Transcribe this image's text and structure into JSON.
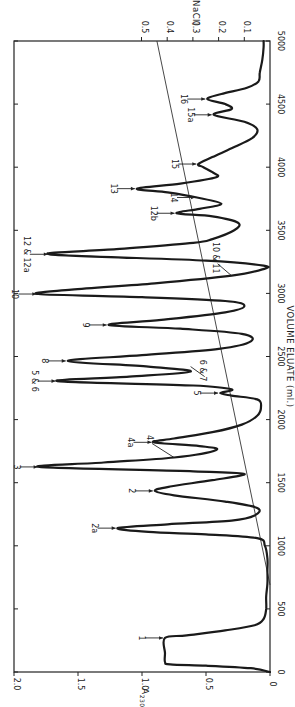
{
  "chart_data": {
    "type": "line",
    "orientation_note": "figure printed rotated 90 degrees counter-clockwise",
    "title": "",
    "xlabel": "VOLUME ELUATE (ml.)",
    "ylabel": "A230",
    "y2label": "[NaCl]",
    "xlim": [
      0,
      5000
    ],
    "ylim": [
      0,
      2.0
    ],
    "y2lim": [
      0,
      0.5
    ],
    "x_ticks": [
      0,
      500,
      1000,
      1500,
      2000,
      2500,
      3000,
      3500,
      4000,
      4500,
      5000
    ],
    "x_tick_labels": [
      "0",
      "500",
      "1000",
      "1500",
      "2000",
      "2500",
      "3000",
      "3500",
      "4000",
      "4500",
      "5000"
    ],
    "y_ticks": [
      0,
      0.5,
      1.0,
      1.5,
      2.0
    ],
    "y_tick_labels": [
      "0",
      "0.5",
      "1.0",
      "1.5",
      "2.0"
    ],
    "y2_ticks": [
      0.1,
      0.2,
      0.3,
      0.4,
      0.5
    ],
    "y2_tick_labels": [
      "0.1",
      "0.2",
      "0.3",
      "0.4",
      "0.5"
    ],
    "grid": false,
    "series": [
      {
        "name": "A230",
        "x": [
          0,
          30,
          50,
          60,
          80,
          150,
          270,
          290,
          330,
          370,
          420,
          500,
          600,
          700,
          800,
          900,
          1000,
          1060,
          1090,
          1110,
          1140,
          1170,
          1200,
          1240,
          1300,
          1350,
          1400,
          1435,
          1470,
          1520,
          1570,
          1590,
          1625,
          1660,
          1700,
          1760,
          1790,
          1820,
          1850,
          1900,
          1960,
          2030,
          2100,
          2160,
          2190,
          2210,
          2240,
          2270,
          2305,
          2340,
          2380,
          2420,
          2465,
          2510,
          2560,
          2620,
          2680,
          2720,
          2750,
          2790,
          2850,
          2900,
          2940,
          2970,
          2995,
          3030,
          3080,
          3140,
          3190,
          3220,
          3260,
          3310,
          3350,
          3400,
          3430,
          3500,
          3560,
          3610,
          3635,
          3670,
          3710,
          3760,
          3800,
          3830,
          3870,
          3920,
          3960,
          4000,
          4025,
          4080,
          4150,
          4230,
          4300,
          4360,
          4415,
          4460,
          4500,
          4540,
          4580,
          4630,
          4680,
          4750,
          4850,
          4950,
          5000
        ],
        "values": [
          0.0,
          0.15,
          0.5,
          0.78,
          0.82,
          0.82,
          0.82,
          0.65,
          0.35,
          0.12,
          0.05,
          0.03,
          0.03,
          0.02,
          0.02,
          0.02,
          0.04,
          0.1,
          0.5,
          0.95,
          1.19,
          0.8,
          0.3,
          0.12,
          0.1,
          0.35,
          0.75,
          0.9,
          0.78,
          0.45,
          0.2,
          0.6,
          1.8,
          1.3,
          0.75,
          0.42,
          0.55,
          0.91,
          0.75,
          0.45,
          0.22,
          0.1,
          0.07,
          0.1,
          0.3,
          0.39,
          0.3,
          0.6,
          1.66,
          1.1,
          0.62,
          0.95,
          1.58,
          1.0,
          0.4,
          0.15,
          0.22,
          0.7,
          1.26,
          0.85,
          0.35,
          0.2,
          0.35,
          1.0,
          1.81,
          1.55,
          0.9,
          0.3,
          0.06,
          0.05,
          0.5,
          1.72,
          1.2,
          0.6,
          0.45,
          0.28,
          0.25,
          0.45,
          0.73,
          0.55,
          0.38,
          0.57,
          0.8,
          1.04,
          0.7,
          0.42,
          0.45,
          0.52,
          0.56,
          0.45,
          0.3,
          0.14,
          0.1,
          0.2,
          0.44,
          0.3,
          0.35,
          0.49,
          0.38,
          0.18,
          0.09,
          0.08,
          0.06,
          0.05,
          0.05
        ]
      },
      {
        "name": "[NaCl] gradient",
        "axis": "y2",
        "x": [
          690,
          5000
        ],
        "values": [
          0.0,
          0.44
        ]
      }
    ],
    "peaks": [
      {
        "label": "1",
        "x": 270,
        "y": 0.82
      },
      {
        "label": "2a",
        "x": 1140,
        "y": 1.19
      },
      {
        "label": "2",
        "x": 1435,
        "y": 0.9
      },
      {
        "label": "3",
        "x": 1625,
        "y": 1.8
      },
      {
        "label": "4",
        "x": 1700,
        "y": 0.75
      },
      {
        "label": "4a",
        "x": 1820,
        "y": 0.91
      },
      {
        "label": "5",
        "x": 2210,
        "y": 0.39
      },
      {
        "label": "5 & 6",
        "x": 2305,
        "y": 1.66
      },
      {
        "label": "6 & 7",
        "x": 2420,
        "y": 0.62
      },
      {
        "label": "8",
        "x": 2465,
        "y": 1.58
      },
      {
        "label": "9",
        "x": 2750,
        "y": 1.26
      },
      {
        "label": "10",
        "x": 2995,
        "y": 1.81
      },
      {
        "label": "10 & 11",
        "x": 3140,
        "y": 0.3
      },
      {
        "label": "12 & 12a",
        "x": 3310,
        "y": 1.72
      },
      {
        "label": "12b",
        "x": 3635,
        "y": 0.73
      },
      {
        "label": "14",
        "x": 3760,
        "y": 0.57
      },
      {
        "label": "13",
        "x": 3830,
        "y": 1.04
      },
      {
        "label": "15",
        "x": 4025,
        "y": 0.56
      },
      {
        "label": "15a",
        "x": 4415,
        "y": 0.44
      },
      {
        "label": "16",
        "x": 4540,
        "y": 0.49
      }
    ]
  },
  "labels": {
    "xlabel": "VOLUME ELUATE (ml.)",
    "ylabel": "A",
    "ylabel_sub": "230",
    "y2label": "[NaCl]"
  }
}
